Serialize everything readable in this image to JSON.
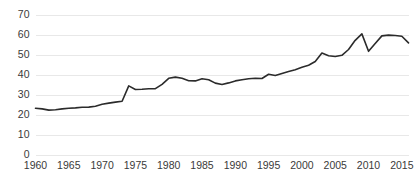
{
  "chart_data": {
    "type": "line",
    "title": "",
    "subtitle": "",
    "xlabel": "",
    "ylabel": "",
    "xlim": [
      1960,
      2016
    ],
    "ylim": [
      0,
      70
    ],
    "grid": "horizontal",
    "legend": "none",
    "colors": {
      "line": "#2b2b2b",
      "gridline": "#e8e8e8",
      "background": "#ffffff",
      "tick_label": "#3a3a3a"
    },
    "y_ticks": [
      0,
      10,
      20,
      30,
      40,
      50,
      60,
      70
    ],
    "y_tick_labels": [
      "0",
      "10",
      "20",
      "30",
      "40",
      "50",
      "60",
      "70"
    ],
    "x_ticks": [
      1960,
      1965,
      1970,
      1975,
      1980,
      1985,
      1990,
      1995,
      2000,
      2005,
      2010,
      2015
    ],
    "x_tick_labels": [
      "1960",
      "1965",
      "1970",
      "1975",
      "1980",
      "1985",
      "1990",
      "1995",
      "2000",
      "2005",
      "2010",
      "2015"
    ],
    "series": [
      {
        "name": "",
        "x": [
          1960,
          1961,
          1962,
          1963,
          1964,
          1965,
          1966,
          1967,
          1968,
          1969,
          1970,
          1971,
          1972,
          1973,
          1974,
          1975,
          1976,
          1977,
          1978,
          1979,
          1980,
          1981,
          1982,
          1983,
          1984,
          1985,
          1986,
          1987,
          1988,
          1989,
          1990,
          1991,
          1992,
          1993,
          1994,
          1995,
          1996,
          1997,
          1998,
          1999,
          2000,
          2001,
          2002,
          2003,
          2004,
          2005,
          2006,
          2007,
          2008,
          2009,
          2010,
          2011,
          2012,
          2013,
          2014,
          2015,
          2016
        ],
        "values": [
          23.6,
          23.3,
          22.7,
          22.9,
          23.3,
          23.6,
          23.8,
          24.1,
          24.2,
          24.6,
          25.6,
          26.2,
          26.7,
          27.1,
          34.8,
          33.0,
          33.1,
          33.4,
          33.4,
          35.6,
          38.6,
          39.2,
          38.6,
          37.4,
          37.3,
          38.4,
          37.9,
          36.2,
          35.5,
          36.3,
          37.3,
          37.9,
          38.4,
          38.6,
          38.5,
          40.6,
          40.0,
          41.0,
          42.0,
          42.9,
          44.1,
          45.1,
          47.0,
          51.2,
          49.9,
          49.5,
          50.1,
          53.0,
          57.6,
          60.8,
          52.1,
          56.0,
          59.8,
          60.2,
          60.0,
          59.6,
          56.3
        ]
      }
    ]
  }
}
